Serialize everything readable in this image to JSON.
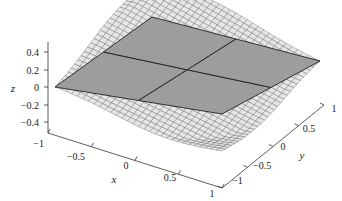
{
  "chart_data": {
    "type": "surface3d",
    "title": "",
    "xlabel": "x",
    "ylabel": "y",
    "zlabel": "z",
    "x_ticks": [
      "−1",
      "−0.5",
      "0",
      "0.5",
      "1"
    ],
    "y_ticks": [
      "−1",
      "−0.5",
      "0",
      "0.5",
      "1"
    ],
    "z_ticks": [
      "0.4",
      "0.2",
      "0",
      "−0.2",
      "−0.4"
    ],
    "xlim": [
      -1,
      1
    ],
    "ylim": [
      -1,
      1
    ],
    "zlim": [
      -0.45,
      0.45
    ],
    "grid": false,
    "legend": null,
    "series": [
      {
        "name": "surface",
        "kind": "mesh",
        "color": "#e6e6e6",
        "edge_color": "#555555",
        "resolution": 30,
        "description": "Surface with discontinuity near origin; high ridges along x=-1 edge and y=1 edge, deep dip toward x=1,y=-1 corner"
      },
      {
        "name": "plane z=0",
        "kind": "plane",
        "z": 0,
        "color": "#9a9a9a",
        "edge_color": "#222222",
        "divisions": 2
      }
    ]
  }
}
